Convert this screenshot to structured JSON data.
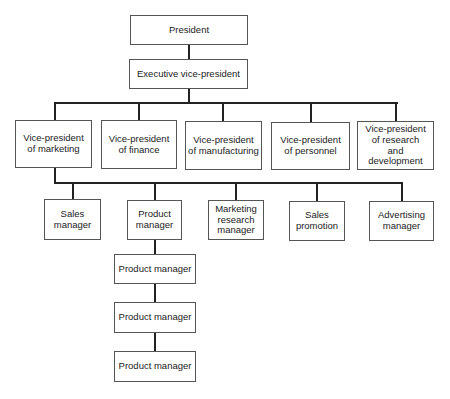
{
  "chart": {
    "president": "President",
    "executive_vp": "Executive vice-president",
    "vice_presidents": [
      "Vice-president\nof marketing",
      "Vice-president\nof finance",
      "Vice-president\nof manufacturing",
      "Vice-president\nof personnel",
      "Vice-president\nof research\nand development"
    ],
    "marketing_reports": [
      "Sales\nmanager",
      "Product\nmanager",
      "Marketing\nresearch\nmanager",
      "Sales\npromotion",
      "Advertising\nmanager"
    ],
    "product_managers": [
      "Product manager",
      "Product manager",
      "Product manager"
    ]
  }
}
